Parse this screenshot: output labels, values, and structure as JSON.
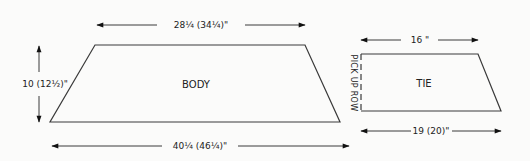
{
  "diagram": {
    "type": "knitting-schematic",
    "colors": {
      "line": "#3a3a3a",
      "text": "#222222",
      "background": "#fbfbfa"
    },
    "body": {
      "label": "BODY",
      "top_width": "28¼ (34¼)\"",
      "bottom_width": "40¼ (46¼)\"",
      "height": "10 (12½)\""
    },
    "tie": {
      "label": "TIE",
      "top_width": "16 \"",
      "bottom_width": "19 (20)\"",
      "side_note": "PICK UP ROW"
    }
  }
}
